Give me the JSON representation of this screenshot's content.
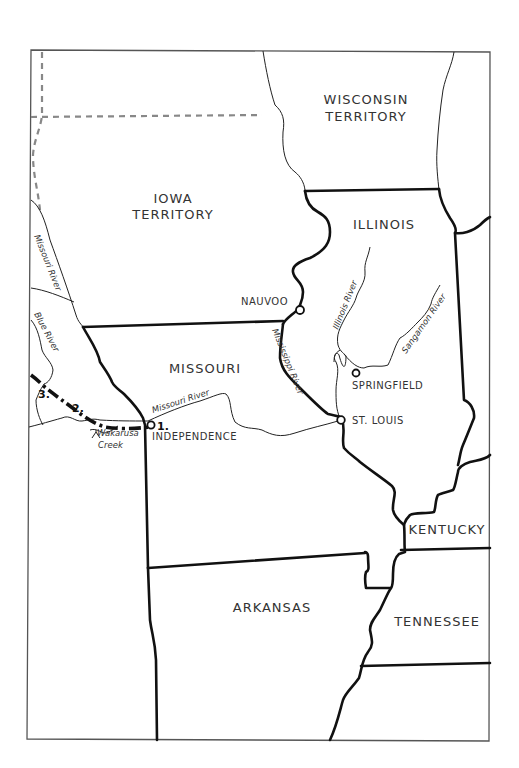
{
  "map": {
    "regions": {
      "wisconsin": [
        "WISCONSIN",
        "TERRITORY"
      ],
      "iowa": [
        "IOWA",
        "TERRITORY"
      ],
      "illinois": "ILLINOIS",
      "missouri": "MISSOURI",
      "kentucky": "KENTUCKY",
      "arkansas": "ARKANSAS",
      "tennessee": "TENNESSEE"
    },
    "cities": {
      "nauvoo": "NAUVOO",
      "springfield": "SPRINGFIELD",
      "st_louis": "ST. LOUIS",
      "independence": "INDEPENDENCE"
    },
    "rivers": {
      "missouri_north": "Missouri River",
      "missouri_east": "Missouri River",
      "mississippi": "Mississippi River",
      "illinois": "Illinois River",
      "sangamon": "Sangamon River",
      "blue": "Blue River",
      "wakarusa_line1": "Wakarusa",
      "wakarusa_line2": "Creek"
    },
    "route_markers": {
      "m1": "1.",
      "m2": "2.",
      "m3": "3."
    },
    "colors": {
      "state_border": "#111111",
      "territory_border": "#888888",
      "river": "#222222",
      "background": "#ffffff"
    }
  }
}
